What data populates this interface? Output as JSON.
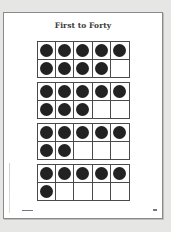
{
  "page": {
    "title": "First to Forty",
    "frames": [
      {
        "label": "ten-frame-1",
        "count": 9,
        "cells": [
          1,
          1,
          1,
          1,
          1,
          1,
          1,
          1,
          1,
          0
        ]
      },
      {
        "label": "ten-frame-2",
        "count": 8,
        "cells": [
          1,
          1,
          1,
          1,
          1,
          1,
          1,
          1,
          0,
          0
        ]
      },
      {
        "label": "ten-frame-3",
        "count": 7,
        "cells": [
          1,
          1,
          1,
          1,
          1,
          1,
          1,
          0,
          0,
          0
        ]
      },
      {
        "label": "ten-frame-4",
        "count": 6,
        "cells": [
          1,
          1,
          1,
          1,
          1,
          1,
          0,
          0,
          0,
          0
        ]
      }
    ],
    "colors": {
      "background": "#e6e6e4",
      "page": "#ffffff",
      "dot": "#222222",
      "grid_line": "#4a4a4a"
    }
  }
}
